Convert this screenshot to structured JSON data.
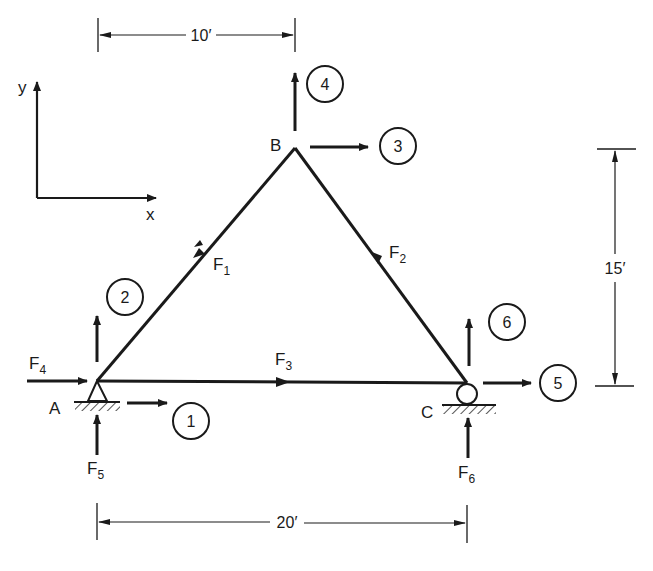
{
  "diagram": {
    "type": "truss-free-body",
    "axes": {
      "x_label": "x",
      "y_label": "y"
    },
    "nodes": [
      {
        "id": "A",
        "label": "A",
        "support": "pin"
      },
      {
        "id": "B",
        "label": "B",
        "support": "none"
      },
      {
        "id": "C",
        "label": "C",
        "support": "roller"
      }
    ],
    "members": [
      {
        "id": "F1",
        "main": "F",
        "sub": "1",
        "from": "A",
        "to": "B"
      },
      {
        "id": "F2",
        "main": "F",
        "sub": "2",
        "from": "B",
        "to": "C"
      },
      {
        "id": "F3",
        "main": "F",
        "sub": "3",
        "from": "A",
        "to": "C"
      }
    ],
    "reactions": [
      {
        "id": "F4",
        "main": "F",
        "sub": "4",
        "node": "A",
        "direction": "x"
      },
      {
        "id": "F5",
        "main": "F",
        "sub": "5",
        "node": "A",
        "direction": "y"
      },
      {
        "id": "F6",
        "main": "F",
        "sub": "6",
        "node": "C",
        "direction": "y"
      }
    ],
    "dof": [
      {
        "number": "1",
        "node": "A",
        "direction": "x"
      },
      {
        "number": "2",
        "node": "A",
        "direction": "y"
      },
      {
        "number": "3",
        "node": "B",
        "direction": "x"
      },
      {
        "number": "4",
        "node": "B",
        "direction": "y"
      },
      {
        "number": "5",
        "node": "C",
        "direction": "x"
      },
      {
        "number": "6",
        "node": "C",
        "direction": "y"
      }
    ],
    "dimensions": {
      "top": "10′",
      "bottom": "20′",
      "right": "15′"
    }
  }
}
